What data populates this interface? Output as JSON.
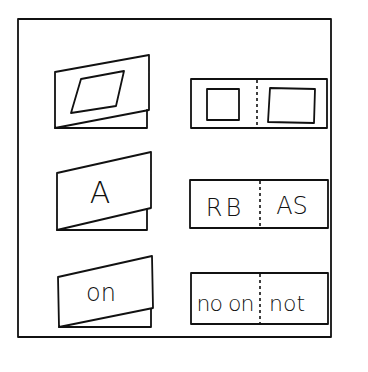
{
  "figure": {
    "type": "folded-cards-illustration",
    "colors": {
      "stroke": "#111111",
      "background": "#ffffff"
    },
    "rows": [
      {
        "folded_card": {
          "content": "parallelogram",
          "label": ""
        },
        "unfolded_card": {
          "left": "square",
          "right": "rectangle",
          "left_text": "",
          "right_text": ""
        }
      },
      {
        "folded_card": {
          "content": "text",
          "label": "A"
        },
        "unfolded_card": {
          "left": "text",
          "right": "text",
          "left_text": "RB",
          "right_text": "AS"
        }
      },
      {
        "folded_card": {
          "content": "text",
          "label": "on"
        },
        "unfolded_card": {
          "left": "text",
          "right": "text",
          "left_text": "no on",
          "right_text": "not"
        }
      }
    ]
  }
}
